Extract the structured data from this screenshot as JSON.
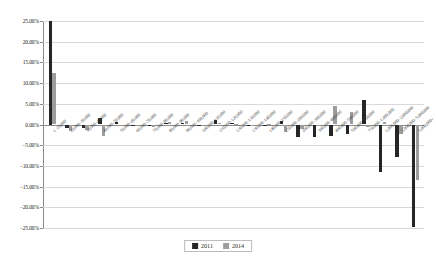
{
  "chart_data": {
    "type": "bar",
    "title": "",
    "xlabel": "",
    "ylabel": "",
    "ylim": [
      -25,
      25
    ],
    "ytick_values": [
      25,
      20,
      15,
      10,
      5,
      0,
      -5,
      -10,
      -15,
      -20,
      -25
    ],
    "ytick_labels": [
      "25.00%",
      "20.00%",
      "15.00%",
      "10.00%",
      "5.00%",
      "0.00%",
      "−5.00%",
      "−10.00%",
      "−15.00%",
      "−20.00%",
      "−25.00%"
    ],
    "grid": true,
    "legend_position": "bottom",
    "categories": [
      "1–20,000",
      "20,000–30,000",
      "30,000–40,000",
      "40,000–50,000",
      "50,000–60,000",
      "60,000–70,000",
      "70,000–80,000",
      "80,000–90,000",
      "90,000–100,000",
      "100,000–110,000",
      "110,000–120,000",
      "120,000–130,000",
      "130,000–140,000",
      "140,000–150,000",
      "150,000–200,000",
      "200,000–300,000",
      "300,000–400,000",
      "400,000–500,000",
      "500,000–750,000",
      "750,000–1,000,000",
      "1,000,000–2,000,000",
      "2,000,000–5,000,000",
      "5,000,000+"
    ],
    "series": [
      {
        "name": "2011",
        "color": "#262626",
        "values": [
          25.0,
          -0.8,
          -0.85,
          1.6,
          0.7,
          -0.2,
          -0.45,
          0.35,
          0.3,
          -0.1,
          1.0,
          0.25,
          -0.15,
          -0.2,
          0.9,
          -2.9,
          -3.0,
          -2.7,
          -2.2,
          6.0,
          -11.4,
          -7.8,
          -24.8
        ]
      },
      {
        "name": "2014",
        "color": "#9d9d9d",
        "values": [
          12.4,
          -1.6,
          -1.3,
          -2.7,
          -0.3,
          -0.1,
          -0.55,
          0.6,
          0.9,
          -0.3,
          0.45,
          0.2,
          -0.05,
          0.15,
          -1.9,
          -1.2,
          -0.4,
          4.5,
          3.0,
          -0.6,
          0.55,
          -2.3,
          -13.4
        ]
      }
    ]
  },
  "legend": {
    "items": [
      {
        "label": "2011",
        "color": "#262626"
      },
      {
        "label": "2014",
        "color": "#9d9d9d"
      }
    ]
  }
}
